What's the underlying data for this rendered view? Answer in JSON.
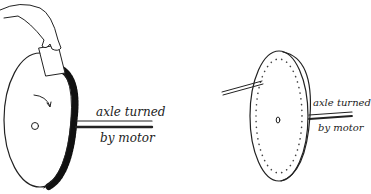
{
  "figure": {
    "left_panel": {
      "label_line1": "axle turned",
      "label_line2": "by motor",
      "parts": [
        "hand",
        "card",
        "toothed-disc",
        "rotation-arrow",
        "hub",
        "axle"
      ]
    },
    "right_panel": {
      "label_line1": "axle turned",
      "label_line2": "by motor",
      "parts": [
        "blow-tube",
        "perforated-disc",
        "hub",
        "axle"
      ]
    },
    "colors": {
      "ink": "#222222",
      "background": "#ffffff"
    }
  }
}
